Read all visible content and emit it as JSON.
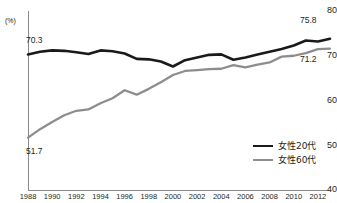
{
  "chart_data": {
    "type": "line",
    "title": "",
    "xlabel": "",
    "ylabel": "",
    "unit_label": "(%)",
    "ylim": [
      40,
      80
    ],
    "yticks": [
      80,
      70,
      60,
      50,
      40
    ],
    "ytick_labels": [
      "80",
      "70",
      "60",
      "50",
      "40"
    ],
    "xlim": [
      1988,
      2013
    ],
    "xticks": [
      1988,
      1990,
      1992,
      1994,
      1996,
      1998,
      2000,
      2002,
      2004,
      2006,
      2008,
      2010,
      2012
    ],
    "xtick_labels": [
      "1988",
      "1990",
      "1992",
      "1994",
      "1996",
      "1998",
      "2000",
      "2002",
      "2004",
      "2006",
      "2008",
      "2010",
      "2012"
    ],
    "grid": false,
    "legend_position": "lower-right",
    "x": [
      1988,
      1989,
      1990,
      1991,
      1992,
      1993,
      1994,
      1995,
      1996,
      1997,
      1998,
      1999,
      2000,
      2001,
      2002,
      2003,
      2004,
      2005,
      2006,
      2007,
      2008,
      2009,
      2010,
      2011,
      2012,
      2013
    ],
    "series": [
      {
        "name": "女性20代",
        "color": "#1a1a1a",
        "values": [
          70.3,
          70.9,
          71.2,
          71.1,
          70.8,
          70.4,
          71.2,
          71.0,
          70.5,
          69.3,
          69.2,
          68.7,
          67.6,
          69.0,
          69.6,
          70.2,
          70.3,
          69.1,
          69.6,
          70.3,
          70.9,
          71.5,
          72.3,
          73.4,
          73.2,
          73.8
        ]
      },
      {
        "name": "女性60代",
        "color": "#8d8d8d",
        "values": [
          51.7,
          53.6,
          55.2,
          56.7,
          57.7,
          58.0,
          59.4,
          60.5,
          62.3,
          61.3,
          62.6,
          64.1,
          65.7,
          66.6,
          66.8,
          67.0,
          67.1,
          67.9,
          67.4,
          68.0,
          68.5,
          69.8,
          70.0,
          70.6,
          71.5,
          71.6
        ]
      }
    ],
    "annotations": [
      {
        "id": "start-a",
        "text": "70.3",
        "series": "女性20代",
        "x": 1988,
        "value": 70.3
      },
      {
        "id": "start-b",
        "text": "51.7",
        "series": "女性60代",
        "x": 1988,
        "value": 51.7
      },
      {
        "id": "end-a",
        "text": "75.8",
        "series": "女性20代",
        "x": 2013,
        "value": 75.8
      },
      {
        "id": "end-b",
        "text": "71.2",
        "series": "女性60代",
        "x": 2013,
        "value": 71.2
      }
    ]
  },
  "axis": {
    "unit": "(%)",
    "y": {
      "t80": "80",
      "t70": "70",
      "t60": "60",
      "t50": "50",
      "t40": "40"
    }
  },
  "legend": {
    "items": [
      {
        "label": "女性20代",
        "color": "#1a1a1a"
      },
      {
        "label": "女性60代",
        "color": "#8d8d8d"
      }
    ]
  },
  "labels": {
    "start_a": "70.3",
    "start_b": "51.7",
    "end_a": "75.8",
    "end_b": "71.2"
  }
}
